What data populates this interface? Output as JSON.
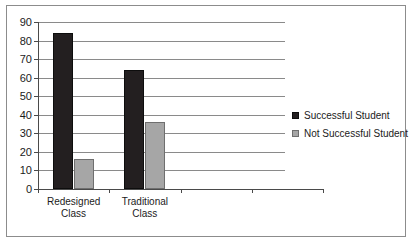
{
  "chart_data": {
    "type": "bar",
    "title": "",
    "xlabel": "",
    "ylabel": "",
    "ylim": [
      0,
      90
    ],
    "ytick_step": 10,
    "yticks": [
      "90",
      "80",
      "70",
      "60",
      "50",
      "40",
      "30",
      "20",
      "10",
      "0"
    ],
    "grid": true,
    "legend_position": "right",
    "categories": [
      "Redesigned Class",
      "Traditional Class",
      "",
      ""
    ],
    "category_label_lines": [
      [
        "Redesigned",
        "Class"
      ],
      [
        "Traditional",
        "Class"
      ],
      [
        "",
        ""
      ],
      [
        "",
        ""
      ]
    ],
    "series": [
      {
        "name": "Successful Student",
        "color": "#231f20",
        "values": [
          84,
          64,
          null,
          null
        ]
      },
      {
        "name": "Not Successful Student",
        "color": "#a6a6a6",
        "values": [
          16,
          36,
          null,
          null
        ]
      }
    ]
  },
  "legend": {
    "entries": [
      {
        "label": "Successful Student"
      },
      {
        "label": "Not Successful Student"
      }
    ]
  },
  "colors": {
    "series_successful": "#231f20",
    "series_not_successful": "#a6a6a6",
    "gridline": "#8a8a8a",
    "axis": "#4a4a4a",
    "frame": "#8c8c8c",
    "text": "#1b1b1b",
    "background": "#ffffff"
  }
}
